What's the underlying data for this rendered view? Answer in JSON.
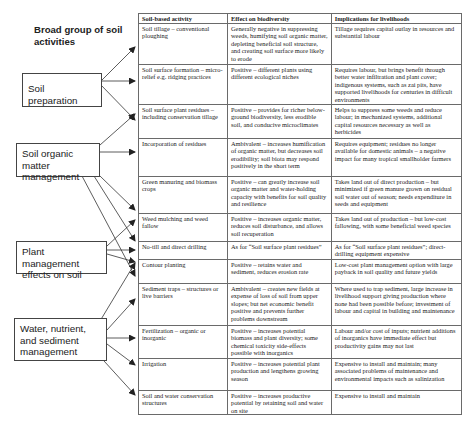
{
  "diagram": {
    "title": "Broad group of soil activities",
    "groups": [
      {
        "id": "soil-preparation",
        "label": "Soil preparation"
      },
      {
        "id": "soil-organic-matter",
        "label": "Soil organic matter management"
      },
      {
        "id": "plant-management",
        "label": "Plant management effects on soil"
      },
      {
        "id": "water-nutrient-sediment",
        "label": "Water, nutrient, and sediment management"
      }
    ],
    "arrows": [
      {
        "from": "soil-preparation",
        "to": "Soil tillage – conventional ploughing"
      },
      {
        "from": "soil-preparation",
        "to": "Soil surface formation – micro-relief e.g. ridging practices"
      },
      {
        "from": "soil-preparation",
        "to": "Soil surface plant residues – including conservation tillage"
      },
      {
        "from": "soil-organic-matter",
        "to": "Soil surface plant residues – including conservation tillage"
      },
      {
        "from": "soil-organic-matter",
        "to": "Incorporation of residues"
      },
      {
        "from": "soil-organic-matter",
        "to": "Green manuring and biomass crops"
      },
      {
        "from": "soil-organic-matter",
        "to": "Weed mulching and weed fallow"
      },
      {
        "from": "soil-organic-matter",
        "to": "Contour planting"
      },
      {
        "from": "plant-management",
        "to": "Weed mulching and weed fallow"
      },
      {
        "from": "plant-management",
        "to": "No-till and direct drilling"
      },
      {
        "from": "plant-management",
        "to": "Contour planting"
      },
      {
        "from": "water-nutrient-sediment",
        "to": "Contour planting"
      },
      {
        "from": "water-nutrient-sediment",
        "to": "Sediment traps – structures or live barriers"
      },
      {
        "from": "water-nutrient-sediment",
        "to": "Fertilization – organic or inorganic"
      },
      {
        "from": "water-nutrient-sediment",
        "to": "Irrigation"
      },
      {
        "from": "water-nutrient-sediment",
        "to": "Soil and water conservation structures"
      }
    ]
  },
  "table": {
    "headers": [
      "Soil-based activity",
      "Effect on biodiversity",
      "Implications for livelihoods"
    ],
    "rows": [
      {
        "activity": "Soil tillage – conventional ploughing",
        "effect": "Generally negative in suppressing weeds, humifying soil organic matter, depleting beneficial soil structure, and creating soil surface more likely to erode",
        "livelihoods": "Tillage requires capital outlay in resources and substantial labour"
      },
      {
        "activity": "Soil surface formation – micro-relief e.g. ridging practices",
        "effect": "Positive – different plants using different ecological niches",
        "livelihoods": "Requires labour, but brings benefit through better water infiltration and plant cover; indigenous systems, such as zai pits, have supported livelihoods for centuries in difficult environments"
      },
      {
        "activity": "Soil surface plant residues – including conservation tillage",
        "effect": "Positive – provides for richer below-ground biodiversity, less erodible soil, and conducive microclimates",
        "livelihoods": "Helps to suppress some weeds and reduce labour; in mechanized systems, additional capital resources necessary as well as herbicides"
      },
      {
        "activity": "Incorporation of residues",
        "effect": "Ambivalent – increases humification of organic matter, but decreases soil erodibility; soil biota may respond positively in the short term",
        "livelihoods": "Requires equipment; residues no longer available for domestic animals – a negative impact for many tropical smallholder farmers"
      },
      {
        "activity": "Green manuring and biomass crops",
        "effect": "Positive – can greatly increase soil organic matter and water-holding capacity with benefits for soil quality and resilience",
        "livelihoods": "Takes land out of direct production – but minimized if green manure grown on residual soil water out of season; needs expenditure in seeds and equipment"
      },
      {
        "activity": "Weed mulching and weed fallow",
        "effect": "Positive – increases organic matter, reduces soil disturbance, and allows soil recuperation",
        "livelihoods": "Takes land out of production – but low-cost fallowing, with some beneficial weed species"
      },
      {
        "activity": "No-till and direct drilling",
        "effect": "As for “Soil surface plant residues”",
        "livelihoods": "As for “Soil surface plant residues”; direct-drilling equipment expensive"
      },
      {
        "activity": "Contour planting",
        "effect": "Positive – retains water and sediment, reduces erosion rate",
        "livelihoods": "Low-cost plant management option with large payback in soil quality and future yields"
      },
      {
        "activity": "Sediment traps – structures or live barriers",
        "effect": "Ambivalent – creates new fields at expense of loss of soil from upper slopes; but net economic benefit positive and prevents further problems downstream",
        "livelihoods": "Where used to trap sediment, large increase in livelihood support giving production where none had been possible before; investment of labour and capital in building and maintenance"
      },
      {
        "activity": "Fertilization – organic or inorganic",
        "effect": "Positive – increases potential biomass and plant diversity; some chemical toxicity side-effects possible with inorganics",
        "livelihoods": "Labour and/or cost of inputs; nutrient additions of inorganics have immediate effect but productivity gains may not last"
      },
      {
        "activity": "Irrigation",
        "effect": "Positive – increases potential plant production and lengthens growing season",
        "livelihoods": "Expensive to install and maintain; many associated problems of maintenance and environmental impacts such as salinization"
      },
      {
        "activity": "Soil and water conservation structures",
        "effect": "Positive – increases productive potential by retaining soil and water on site",
        "livelihoods": "Expensive to install and maintain"
      }
    ]
  }
}
